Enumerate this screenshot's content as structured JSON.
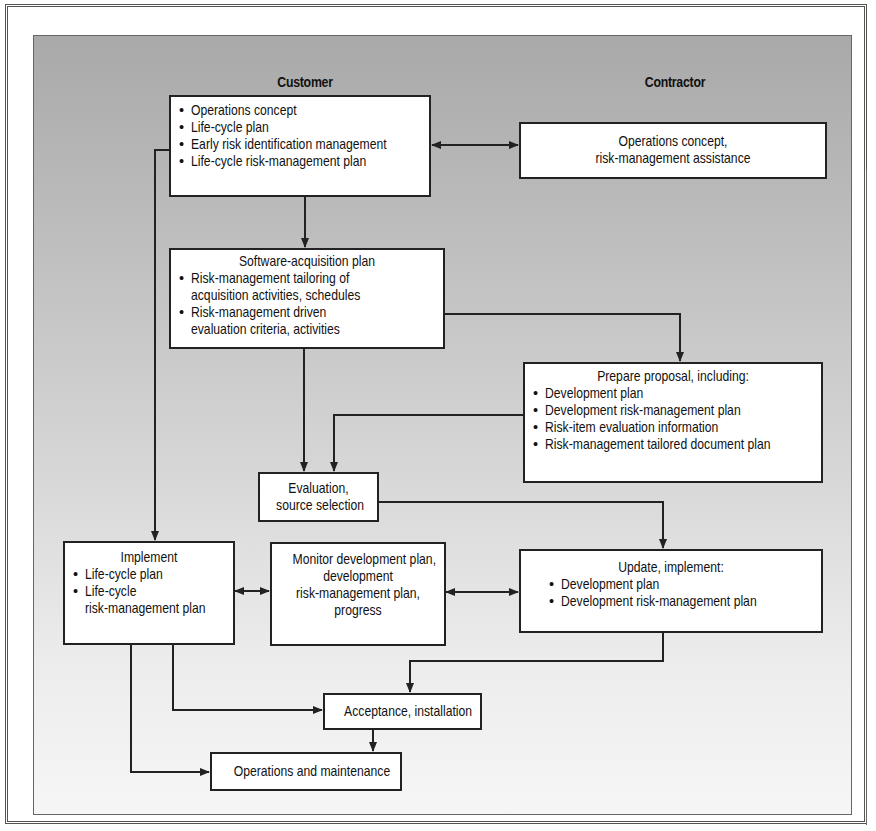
{
  "diagram": {
    "headings": {
      "customer": "Customer",
      "contractor": "Contractor"
    },
    "boxes": {
      "customer_initial": {
        "items": [
          "Operations concept",
          "Life-cycle plan",
          "Early risk identification management",
          "Life-cycle risk-management plan"
        ]
      },
      "contractor_assist": {
        "lines": [
          "Operations concept,",
          "risk-management assistance"
        ]
      },
      "acquisition_plan": {
        "title": "Software-acquisition plan",
        "items": [
          [
            "Risk-management tailoring of",
            "acquisition activities, schedules"
          ],
          [
            "Risk-management driven",
            "evaluation criteria, activities"
          ]
        ]
      },
      "proposal": {
        "title": "Prepare proposal, including:",
        "items": [
          "Development plan",
          "Development risk-management plan",
          "Risk-item evaluation information",
          "Risk-management tailored document plan"
        ]
      },
      "evaluation": {
        "lines": [
          "Evaluation,",
          "source selection"
        ]
      },
      "implement": {
        "title": "Implement",
        "items": [
          [
            "Life-cycle plan"
          ],
          [
            "Life-cycle",
            "risk-management plan"
          ]
        ]
      },
      "monitor": {
        "lines": [
          "Monitor development plan,",
          "development",
          "risk-management plan,",
          "progress"
        ]
      },
      "update": {
        "title": "Update, implement:",
        "items": [
          "Development plan",
          "Development risk-management plan"
        ]
      },
      "acceptance": {
        "label": "Acceptance, installation"
      },
      "operations": {
        "label": "Operations and maintenance"
      }
    },
    "bullet": "•",
    "colors": {
      "line": "#222222",
      "box_fill": "#ffffff",
      "panel_top": "#a9a9a9",
      "panel_bottom": "#f6f6f6"
    }
  }
}
